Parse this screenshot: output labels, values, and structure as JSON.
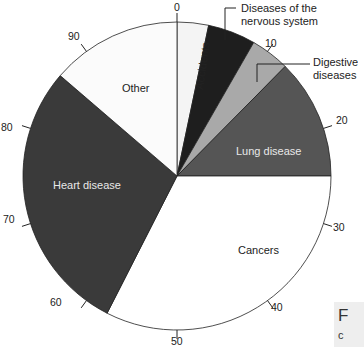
{
  "chart_data": {
    "type": "pie",
    "title": "",
    "scale": {
      "min": 0,
      "max": 100,
      "ticks": [
        0,
        10,
        20,
        30,
        40,
        50,
        60,
        70,
        80,
        90
      ]
    },
    "slices": [
      {
        "label": "Accidents",
        "start": 0,
        "end": 3.3,
        "value": 3.3,
        "color": "#f4f4f4"
      },
      {
        "label": "Diseases of the nervous system",
        "start": 3.3,
        "end": 8.3,
        "value": 5.0,
        "color": "#1e1e1e"
      },
      {
        "label": "Digestive diseases",
        "start": 8.3,
        "end": 12.4,
        "value": 4.1,
        "color": "#a9a9a9"
      },
      {
        "label": "Lung disease",
        "start": 12.4,
        "end": 25.0,
        "value": 12.6,
        "color": "#555555"
      },
      {
        "label": "Cancers",
        "start": 25.0,
        "end": 57.5,
        "value": 32.5,
        "color": "#ffffff"
      },
      {
        "label": "Heart disease",
        "start": 57.5,
        "end": 86.3,
        "value": 28.8,
        "color": "#3a3a3a"
      },
      {
        "label": "Other",
        "start": 86.3,
        "end": 100,
        "value": 13.7,
        "color": "#fbfbfb"
      }
    ]
  },
  "labels": {
    "accidents": "Accidents",
    "nervous_1": "Diseases of the",
    "nervous_2": "nervous system",
    "digestive_1": "Digestive",
    "digestive_2": "diseases",
    "lung": "Lung disease",
    "cancers": "Cancers",
    "heart": "Heart disease",
    "other": "Other"
  },
  "ticks": {
    "t0": "0",
    "t10": "10",
    "t20": "20",
    "t30": "30",
    "t40": "40",
    "t50": "50",
    "t60": "60",
    "t70": "70",
    "t80": "80",
    "t90": "90"
  },
  "caption": {
    "line1": "F",
    "line2": "c"
  }
}
